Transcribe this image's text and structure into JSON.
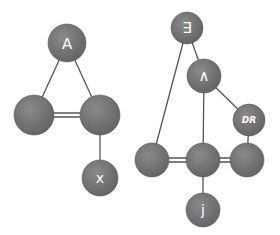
{
  "diagram": {
    "colors": {
      "node_fill": "#6e6e6e",
      "node_highlight": "#8a8a8a",
      "edge": "#555555",
      "label": "#ffffff",
      "background": "#ffffff"
    },
    "nodes": [
      {
        "id": "forall",
        "label": "∀",
        "rotated": true,
        "x": 67,
        "y": 43,
        "r": 19
      },
      {
        "id": "left-a",
        "label": "",
        "x": 34,
        "y": 115,
        "r": 20
      },
      {
        "id": "left-b",
        "label": "",
        "x": 100,
        "y": 115,
        "r": 20
      },
      {
        "id": "x",
        "label": "x",
        "x": 100,
        "y": 178,
        "r": 18
      },
      {
        "id": "exists",
        "label": "∃",
        "x": 187,
        "y": 28,
        "r": 16
      },
      {
        "id": "and",
        "label": "∧",
        "x": 204,
        "y": 76,
        "r": 17
      },
      {
        "id": "dr",
        "label": "DR",
        "x": 249,
        "y": 120,
        "r": 16
      },
      {
        "id": "right-a",
        "label": "",
        "x": 152,
        "y": 160,
        "r": 17
      },
      {
        "id": "right-b",
        "label": "",
        "x": 203,
        "y": 160,
        "r": 17
      },
      {
        "id": "right-c",
        "label": "",
        "x": 247,
        "y": 160,
        "r": 17
      },
      {
        "id": "j",
        "label": "j",
        "x": 203,
        "y": 210,
        "r": 17
      }
    ],
    "edges": [
      {
        "from": "forall",
        "to": "left-a",
        "type": "single"
      },
      {
        "from": "forall",
        "to": "left-b",
        "type": "single"
      },
      {
        "from": "left-a",
        "to": "left-b",
        "type": "double"
      },
      {
        "from": "left-b",
        "to": "x",
        "type": "single"
      },
      {
        "from": "exists",
        "to": "and",
        "type": "single"
      },
      {
        "from": "exists",
        "to": "right-a",
        "type": "single"
      },
      {
        "from": "and",
        "to": "dr",
        "type": "single"
      },
      {
        "from": "and",
        "to": "right-b",
        "type": "single"
      },
      {
        "from": "dr",
        "to": "right-c",
        "type": "single"
      },
      {
        "from": "right-a",
        "to": "right-b",
        "type": "double"
      },
      {
        "from": "right-b",
        "to": "right-c",
        "type": "double"
      },
      {
        "from": "right-b",
        "to": "j",
        "type": "single"
      }
    ]
  }
}
